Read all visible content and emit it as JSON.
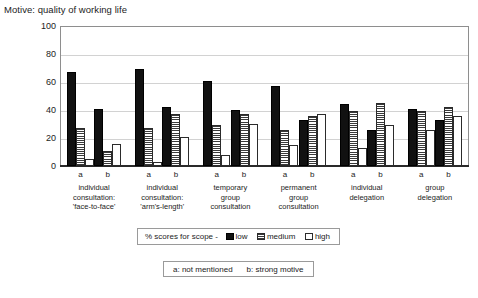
{
  "chart_data": {
    "type": "bar",
    "title": "Motive: quality of working life",
    "xlabel": "",
    "ylabel": "",
    "ylim": [
      0,
      100
    ],
    "yticks": [
      0,
      20,
      40,
      60,
      80,
      100
    ],
    "grid": true,
    "legend_position": "below-axes",
    "legend_prefix": "% scores for scope -",
    "series_names": [
      "low",
      "medium",
      "high"
    ],
    "subgroup_keys": [
      "a",
      "b"
    ],
    "subgroup_note_a": "a: not mentioned",
    "subgroup_note_b": "b: strong motive",
    "categories": [
      "individual\nconsultation:\n'face-to-face'",
      "individual\nconsultation:\n'arm's-length'",
      "temporary\ngroup\nconsultation",
      "permanent\ngroup\nconsultation",
      "individual\ndelegation",
      "group\ndelegation"
    ],
    "groups": [
      {
        "category": "individual consultation: 'face-to-face'",
        "a": {
          "low": 67,
          "medium": 27,
          "high": 5
        },
        "b": {
          "low": 41,
          "medium": 11,
          "high": 16
        }
      },
      {
        "category": "individual consultation: 'arm's-length'",
        "a": {
          "low": 69,
          "medium": 27,
          "high": 3
        },
        "b": {
          "low": 42,
          "medium": 37,
          "high": 21
        }
      },
      {
        "category": "temporary group consultation",
        "a": {
          "low": 61,
          "medium": 29,
          "high": 8
        },
        "b": {
          "low": 40,
          "medium": 37,
          "high": 30
        }
      },
      {
        "category": "permanent group consultation",
        "a": {
          "low": 57,
          "medium": 26,
          "high": 15
        },
        "b": {
          "low": 33,
          "medium": 36,
          "high": 37
        }
      },
      {
        "category": "individual delegation",
        "a": {
          "low": 44,
          "medium": 39,
          "high": 13
        },
        "b": {
          "low": 26,
          "medium": 45,
          "high": 29
        }
      },
      {
        "category": "group delegation",
        "a": {
          "low": 41,
          "medium": 39,
          "high": 26
        },
        "b": {
          "low": 33,
          "medium": 42,
          "high": 36
        }
      }
    ],
    "colors": {
      "low": "#111111",
      "medium": "#ffffff",
      "high": "#ffffff",
      "grid": "#d2d2d2",
      "frame": "#8e8e8e",
      "text": "#1c1c1c"
    }
  }
}
